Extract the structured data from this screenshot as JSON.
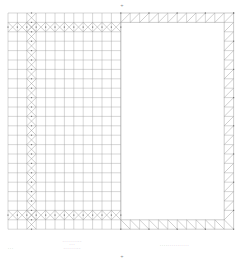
{
  "drawing": {
    "type": "structural grid / mesh drawing",
    "grid": {
      "origin_x": 8,
      "origin_y": 13,
      "cell": 9.4,
      "cols": 24,
      "rows": 23,
      "line_color": "#9a9a9a",
      "brace_color": "#8a8a8a",
      "node_color": "#777777"
    },
    "left_region": {
      "cols": [
        0,
        12
      ],
      "braced_rows": [
        1,
        21
      ],
      "braced_cols": [
        2
      ]
    },
    "right_region": {
      "cols": [
        12,
        24
      ],
      "frame_thickness_cells": 1,
      "hatch": "single-diagonal"
    },
    "top_mark": "+",
    "bottom_mark": "+"
  },
  "title_block": {
    "left_note": "- - -",
    "center_lines": [
      "- - - - - - - - - -",
      "- - -",
      "- - - - - - - - -"
    ],
    "right_line": "- - - - - - - - - - - - - - -"
  }
}
